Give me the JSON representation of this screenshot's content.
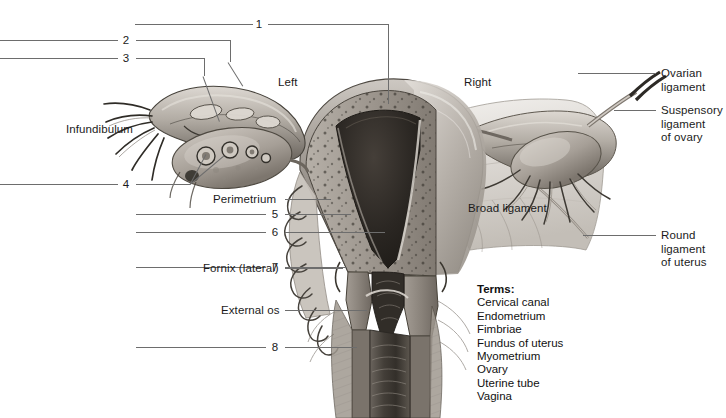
{
  "figure": {
    "top_caption_remnant": "",
    "orientation": {
      "left_label": "Left",
      "right_label": "Right"
    },
    "colors": {
      "leader_line": "#6d6d6d",
      "text": "#1b1b1b",
      "background": "#ffffff",
      "tissue_light": "#d8d4cf",
      "tissue_mid": "#9b958e",
      "tissue_dark": "#4a4540",
      "cavity_dark": "#2a2622"
    }
  },
  "numbered_callouts": [
    {
      "id": "1",
      "number": "1",
      "x": 258,
      "y": 18
    },
    {
      "id": "2",
      "number": "2",
      "x": 122,
      "y": 34
    },
    {
      "id": "3",
      "number": "3",
      "x": 122,
      "y": 52
    },
    {
      "id": "4",
      "number": "4",
      "x": 122,
      "y": 178
    },
    {
      "id": "5",
      "number": "5",
      "x": 271,
      "y": 208
    },
    {
      "id": "6",
      "number": "6",
      "x": 271,
      "y": 226
    },
    {
      "id": "7",
      "number": "7",
      "x": 271,
      "y": 261
    },
    {
      "id": "8",
      "number": "8",
      "x": 271,
      "y": 341
    }
  ],
  "text_labels": [
    {
      "id": "left",
      "text": "Left",
      "x": 278,
      "y": 76
    },
    {
      "id": "right",
      "text": "Right",
      "x": 464,
      "y": 76
    },
    {
      "id": "infundibulum",
      "text": "Infundibulum",
      "x": 66,
      "y": 123
    },
    {
      "id": "perimetrium",
      "text": "Perimetrium",
      "x": 213,
      "y": 194
    },
    {
      "id": "broad-ligament",
      "text": "Broad ligament",
      "x": 468,
      "y": 203
    },
    {
      "id": "fornix-lateral",
      "text": "Fornix (lateral)",
      "x": 203,
      "y": 263
    },
    {
      "id": "external-os",
      "text": "External os",
      "x": 221,
      "y": 305
    },
    {
      "id": "ovarian-ligament",
      "text": "Ovarian\nligament",
      "x": 661,
      "y": 67
    },
    {
      "id": "suspensory-ligament-of-ovary",
      "text": "Suspensory\nligament\nof ovary",
      "x": 661,
      "y": 104
    },
    {
      "id": "round-ligament-of-uterus",
      "text": "Round\nligament\nof uterus",
      "x": 661,
      "y": 229
    }
  ],
  "terms_box": {
    "heading": "Terms:",
    "x": 477,
    "y": 283,
    "items": [
      "Cervical canal",
      "Endometrium",
      "Fimbriae",
      "Fundus of uterus",
      "Myometrium",
      "Ovary",
      "Uterine tube",
      "Vagina"
    ]
  }
}
